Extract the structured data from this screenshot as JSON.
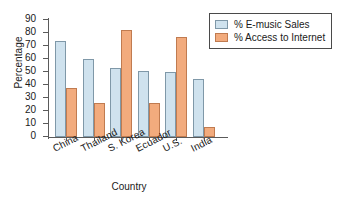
{
  "chart_data": {
    "type": "bar",
    "title": "",
    "xlabel": "Country",
    "ylabel": "Percentage",
    "categories": [
      "China",
      "Thailand",
      "S. Korea",
      "Ecuador",
      "U.S.",
      "India"
    ],
    "series": [
      {
        "name": "% E-music Sales",
        "color": "#cfe2ee",
        "values": [
          74,
          60,
          53,
          51,
          50,
          45
        ]
      },
      {
        "name": "% Access to Internet",
        "color": "#f2ab7d",
        "values": [
          38,
          26,
          82,
          26,
          77,
          8
        ]
      }
    ],
    "ylim": [
      0,
      90
    ],
    "ytick_labels": [
      "90",
      "80",
      "70",
      "60",
      "50",
      "40",
      "30",
      "20",
      "10",
      "0"
    ],
    "ytick_values": [
      90,
      80,
      70,
      60,
      50,
      40,
      30,
      20,
      10,
      0
    ],
    "grid": false,
    "legend_position": "top-right"
  }
}
